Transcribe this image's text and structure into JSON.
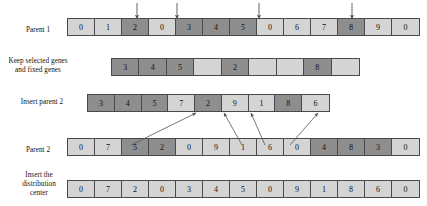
{
  "figure": {
    "type": "diagram"
  },
  "rows": [
    {
      "id": "parent1",
      "label": "Parent 1",
      "label_x": 14,
      "label_y": 26,
      "label_w": 48,
      "x": 67,
      "y": 18,
      "w": 353,
      "h": 18,
      "cells": [
        {
          "value": "0",
          "shade": "light"
        },
        {
          "value": "1",
          "shade": "light"
        },
        {
          "value": "2",
          "shade": "dark"
        },
        {
          "value": "0",
          "shade": "light"
        },
        {
          "value": "3",
          "shade": "dark"
        },
        {
          "value": "4",
          "shade": "dark"
        },
        {
          "value": "5",
          "shade": "dark"
        },
        {
          "value": "0",
          "shade": "light"
        },
        {
          "value": "6",
          "shade": "light"
        },
        {
          "value": "7",
          "shade": "light"
        },
        {
          "value": "8",
          "shade": "dark"
        },
        {
          "value": "9",
          "shade": "light"
        },
        {
          "value": "0",
          "shade": "light"
        }
      ]
    },
    {
      "id": "keep-selected",
      "label": "Keep selected genes\nand fixed genes",
      "label_x": 6,
      "label_y": 57,
      "label_w": 64,
      "x": 111,
      "y": 58,
      "w": 249,
      "h": 18,
      "cells": [
        {
          "value": "3",
          "shade": "dark"
        },
        {
          "value": "4",
          "shade": "dark"
        },
        {
          "value": "5",
          "shade": "dark"
        },
        {
          "value": "",
          "shade": "light"
        },
        {
          "value": "2",
          "shade": "dark"
        },
        {
          "value": "",
          "shade": "light"
        },
        {
          "value": "",
          "shade": "light"
        },
        {
          "value": "8",
          "shade": "dark"
        },
        {
          "value": "",
          "shade": "light"
        }
      ]
    },
    {
      "id": "insert-parent2",
      "label": "Insert parent 2",
      "label_x": 6,
      "label_y": 98,
      "label_w": 72,
      "x": 87,
      "y": 94,
      "w": 243,
      "h": 18,
      "cells": [
        {
          "value": "3",
          "shade": "dark"
        },
        {
          "value": "4",
          "shade": "dark"
        },
        {
          "value": "5",
          "shade": "dark"
        },
        {
          "value": "7",
          "shade": "light"
        },
        {
          "value": "2",
          "shade": "dark"
        },
        {
          "value": "9",
          "shade": "light"
        },
        {
          "value": "1",
          "shade": "light"
        },
        {
          "value": "8",
          "shade": "dark"
        },
        {
          "value": "6",
          "shade": "light"
        }
      ]
    },
    {
      "id": "parent2",
      "label": "Parent 2",
      "label_x": 14,
      "label_y": 146,
      "label_w": 48,
      "x": 67,
      "y": 138,
      "w": 353,
      "h": 18,
      "cells": [
        {
          "value": "0",
          "shade": "light"
        },
        {
          "value": "7",
          "shade": "light"
        },
        {
          "value": "5",
          "shade": "dark"
        },
        {
          "value": "2",
          "shade": "dark"
        },
        {
          "value": "0",
          "shade": "light"
        },
        {
          "value": "9",
          "shade": "light"
        },
        {
          "value": "1",
          "shade": "light"
        },
        {
          "value": "6",
          "shade": "light"
        },
        {
          "value": "0",
          "shade": "light"
        },
        {
          "value": "4",
          "shade": "dark"
        },
        {
          "value": "8",
          "shade": "dark"
        },
        {
          "value": "3",
          "shade": "dark"
        },
        {
          "value": "0",
          "shade": "light"
        }
      ]
    },
    {
      "id": "insert-distribution-center",
      "label": "Insert the\ndistribution\ncenter",
      "label_x": 12,
      "label_y": 171,
      "label_w": 54,
      "x": 67,
      "y": 180,
      "w": 353,
      "h": 18,
      "cells": [
        {
          "value": "0",
          "shade": "light"
        },
        {
          "value": "7",
          "shade": "light"
        },
        {
          "value": "2",
          "shade": "light"
        },
        {
          "value": "0",
          "shade": "light"
        },
        {
          "value": "3",
          "shade": "light"
        },
        {
          "value": "4",
          "shade": "light"
        },
        {
          "value": "5",
          "shade": "light"
        },
        {
          "value": "0",
          "shade": "light"
        },
        {
          "value": "9",
          "shade": "light"
        },
        {
          "value": "1",
          "shade": "light"
        },
        {
          "value": "8",
          "shade": "light"
        },
        {
          "value": "6",
          "shade": "light"
        },
        {
          "value": "0",
          "shade": "light"
        }
      ]
    }
  ],
  "down_arrows": [
    {
      "x": 137,
      "y1": 3,
      "y2": 19
    },
    {
      "x": 177,
      "y1": 3,
      "y2": 19
    },
    {
      "x": 259,
      "y1": 3,
      "y2": 19
    },
    {
      "x": 352,
      "y1": 3,
      "y2": 19
    }
  ],
  "diagonal_arrows": [
    {
      "x1": 131,
      "y1": 145,
      "x2": 196,
      "y2": 113
    },
    {
      "x1": 242,
      "y1": 145,
      "x2": 224,
      "y2": 113
    },
    {
      "x1": 265,
      "y1": 145,
      "x2": 251,
      "y2": 113
    },
    {
      "x1": 290,
      "y1": 145,
      "x2": 318,
      "y2": 113
    }
  ],
  "colors": {
    "light_cell": "#d4d4d4",
    "dark_cell": "#8e8e8e",
    "border": "#4a4a4a",
    "arrow": "#555555",
    "text": "#111111",
    "background": "#ffffff"
  }
}
